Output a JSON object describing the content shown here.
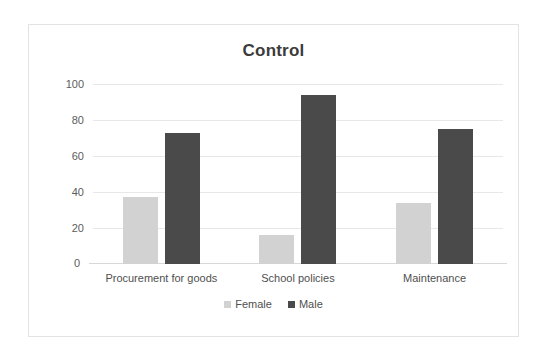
{
  "chart_data": {
    "type": "bar",
    "title": "Control",
    "xlabel": "",
    "ylabel": "",
    "ylim": [
      0,
      100
    ],
    "yticks": [
      100,
      80,
      60,
      40,
      20,
      0
    ],
    "grid": true,
    "legend_position": "bottom",
    "categories": [
      "Procurement for goods",
      "School policies",
      "Maintenance"
    ],
    "series": [
      {
        "name": "Female",
        "color": "#d2d2d2",
        "values": [
          37,
          16,
          34
        ]
      },
      {
        "name": "Male",
        "color": "#4a4a4a",
        "values": [
          73,
          94,
          75
        ]
      }
    ]
  },
  "frame": {
    "border_color": "#e3e3e3",
    "background": "#ffffff"
  }
}
